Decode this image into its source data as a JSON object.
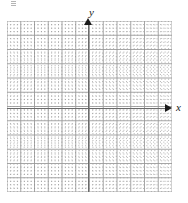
{
  "figure": {
    "type": "coordinate-grid"
  },
  "axes": {
    "x_label": "x",
    "y_label": "y",
    "x_arrow_icon": "arrow-right-icon",
    "y_arrow_icon": "arrow-up-icon",
    "axis_color": "#6b6b6b",
    "arrow_color": "#1a1a1a"
  },
  "grid": {
    "minor_color": "#787878",
    "major_color": "#969696",
    "background": "#ffffff",
    "major_cells_x": 12,
    "major_cells_y": 12,
    "minor_per_major": 4
  },
  "chart_data": {
    "type": "scatter",
    "title": "",
    "subtitle": "",
    "xlabel": "x",
    "ylabel": "y",
    "xlim": [
      -6,
      6
    ],
    "ylim": [
      -6,
      6.5
    ],
    "xticks": [
      -6,
      -5,
      -4,
      -3,
      -2,
      -1,
      0,
      1,
      2,
      3,
      4,
      5,
      6
    ],
    "yticks": [
      -6,
      -5,
      -4,
      -3,
      -2,
      -1,
      0,
      1,
      2,
      3,
      4,
      5,
      6
    ],
    "xticklabels": [
      "",
      "",
      "",
      "",
      "",
      "",
      "",
      "",
      "",
      "",
      "",
      "",
      ""
    ],
    "yticklabels": [
      "",
      "",
      "",
      "",
      "",
      "",
      "",
      "",
      "",
      "",
      "",
      "",
      ""
    ],
    "grid": true,
    "legend": null,
    "series": [],
    "x": [],
    "values": [],
    "annotations": []
  }
}
